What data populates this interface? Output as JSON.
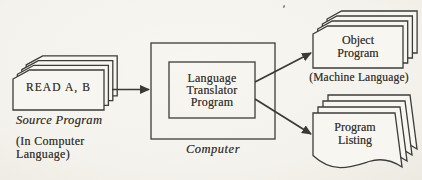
{
  "colors": {
    "ink": "#3d3c38",
    "background": "#f4f2ec",
    "sheet_fill": "#f8f6f1"
  },
  "source_stack": {
    "sheet_text": "READ A, B",
    "caption": "Source Program",
    "note": "(In Computer\nLanguage)"
  },
  "computer": {
    "program_label": "Language\nTranslator\nProgram",
    "caption": "Computer"
  },
  "object_stack": {
    "sheet_text": "Object\nProgram",
    "note": "(Machine Language)"
  },
  "listing_stack": {
    "sheet_text": "Program\nListing"
  }
}
